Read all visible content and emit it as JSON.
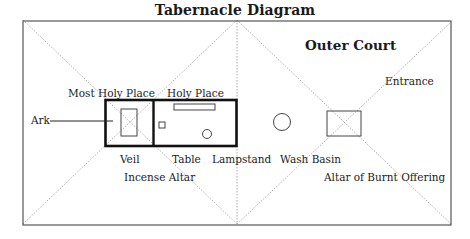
{
  "title": "Tabernacle Diagram",
  "regions": {
    "outer_court": "Outer Court",
    "most_holy_place": "Most Holy Place",
    "holy_place": "Holy Place",
    "entrance": "Entrance"
  },
  "items": {
    "ark": "Ark",
    "veil": "Veil",
    "table": "Table",
    "lampstand": "Lampstand",
    "incense_altar": "Incense Altar",
    "wash_basin": "Wash Basin",
    "altar_of_burnt_offering": "Altar of Burnt Offering"
  },
  "colors": {
    "frame": "#555555",
    "heavy": "#111111",
    "dotted": "#999999"
  }
}
